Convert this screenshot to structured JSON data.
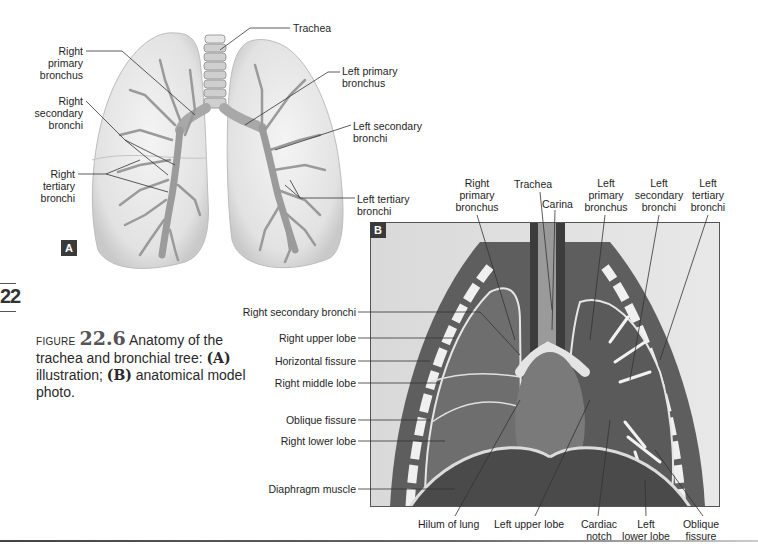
{
  "chapter_tab": "22",
  "panel_a": {
    "badge": "A",
    "labels": {
      "trachea": "Trachea",
      "right_primary_bronchus": [
        "Right",
        "primary",
        "bronchus"
      ],
      "right_secondary_bronchi": [
        "Right",
        "secondary",
        "bronchi"
      ],
      "right_tertiary_bronchi": [
        "Right",
        "tertiary",
        "bronchi"
      ],
      "left_primary_bronchus": [
        "Left primary",
        "bronchus"
      ],
      "left_secondary_bronchi": [
        "Left secondary",
        "bronchi"
      ],
      "left_tertiary_bronchi": [
        "Left tertiary",
        "bronchi"
      ]
    }
  },
  "panel_b": {
    "badge": "B",
    "top_labels": {
      "right_primary_bronchus": [
        "Right",
        "primary",
        "bronchus"
      ],
      "trachea": "Trachea",
      "carina": "Carina",
      "left_primary_bronchus": [
        "Left",
        "primary",
        "bronchus"
      ],
      "left_secondary_bronchi": [
        "Left",
        "secondary",
        "bronchi"
      ],
      "left_tertiary_bronchi": [
        "Left",
        "tertiary",
        "bronchi"
      ]
    },
    "left_labels": [
      "Right secondary bronchi",
      "Right upper lobe",
      "Horizontal fissure",
      "Right middle lobe",
      "Oblique fissure",
      "Right lower lobe",
      "Diaphragm muscle"
    ],
    "bottom_labels": {
      "hilum": "Hilum of lung",
      "left_upper_lobe": "Left upper lobe",
      "cardiac_notch": [
        "Cardiac",
        "notch"
      ],
      "left_lower_lobe": [
        "Left",
        "lower lobe"
      ],
      "oblique_fissure": [
        "Oblique",
        "fissure"
      ]
    }
  },
  "caption": {
    "figure_word": "FIGURE",
    "figure_number": "22.6",
    "text_1": " Anatomy of the trachea and bronchial tree: ",
    "a": "(A)",
    "text_2": " illustration; ",
    "b": "(B)",
    "text_3": " anatomical model photo."
  }
}
